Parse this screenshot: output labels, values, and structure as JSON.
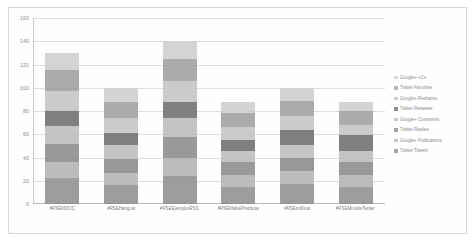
{
  "chart_data": {
    "type": "bar",
    "stacked": true,
    "title": "",
    "xlabel": "",
    "ylabel": "",
    "ylim": [
      0,
      160
    ],
    "ytick_labels": [
      "0",
      "20",
      "40",
      "60",
      "80",
      "100",
      "120",
      "140",
      "160"
    ],
    "grid": true,
    "legend_position": "right",
    "categories": [
      "#RSEMOOC",
      "#RSEHangout",
      "#RSEEjemplosRSS",
      "#RSEMalasPracticas",
      "#RSEmiKlout",
      "#RSEMoodleTwitter"
    ],
    "totals": [
      130,
      100,
      140,
      88,
      100,
      88
    ],
    "series": [
      {
        "name": "Twitter Tweets",
        "color": "#909090",
        "values": [
          22,
          16,
          24,
          15,
          17,
          15
        ]
      },
      {
        "name": "Google+ Publications",
        "color": "#b4b4b4",
        "values": [
          14,
          11,
          16,
          10,
          11,
          10
        ]
      },
      {
        "name": "Twitter Replies",
        "color": "#8c8c8c",
        "values": [
          16,
          12,
          18,
          11,
          12,
          11
        ]
      },
      {
        "name": "Google+ Comments",
        "color": "#bdbdbd",
        "values": [
          15,
          12,
          16,
          10,
          11,
          10
        ]
      },
      {
        "name": "Twitter Retweets",
        "color": "#6f6f6f",
        "values": [
          13,
          10,
          14,
          9,
          13,
          13
        ]
      },
      {
        "name": "Google+ Reshares",
        "color": "#c4c4c4",
        "values": [
          17,
          13,
          18,
          11,
          12,
          9
        ]
      },
      {
        "name": "Twitter Favorites",
        "color": "#a0a0a0",
        "values": [
          18,
          14,
          19,
          12,
          13,
          12
        ]
      },
      {
        "name": "Google+ +1's",
        "color": "#cfcfcf",
        "values": [
          15,
          12,
          15,
          10,
          11,
          8
        ]
      }
    ],
    "legend_order": [
      "Google+ +1's",
      "Twitter Favorites",
      "Google+ Reshares",
      "Twitter Retweets",
      "Google+ Comments",
      "Twitter Replies",
      "Google+ Publications",
      "Twitter Tweets"
    ]
  }
}
